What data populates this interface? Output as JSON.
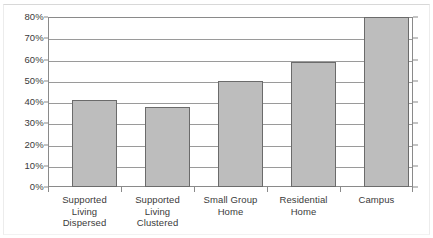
{
  "chart_data": {
    "type": "bar",
    "title": "",
    "subtitle": "",
    "xlabel": "",
    "ylabel": "",
    "categories": [
      "Supported Living Dispersed",
      "Supported Living Clustered",
      "Small Group Home",
      "Residential Home",
      "Campus"
    ],
    "category_lines": [
      [
        "Supported",
        "Living",
        "Dispersed"
      ],
      [
        "Supported",
        "Living",
        "Clustered"
      ],
      [
        "Small Group",
        "Home"
      ],
      [
        "Residential",
        "Home"
      ],
      [
        "Campus"
      ]
    ],
    "values": [
      41,
      37.5,
      50,
      59,
      80
    ],
    "value_labels": [
      "41%",
      "37.5%",
      "50%",
      "59%",
      "80%"
    ],
    "ylim": [
      0,
      80
    ],
    "ytick_values": [
      0,
      10,
      20,
      30,
      40,
      50,
      60,
      70,
      80
    ],
    "ytick_labels": [
      "0%",
      "10%",
      "20%",
      "30%",
      "40%",
      "50%",
      "60%",
      "70%",
      "80%"
    ],
    "grid": true,
    "legend": null,
    "legend_position": "none",
    "colors": {
      "bar_fill": "#bdbdbd",
      "bar_stroke": "#6b6b6b",
      "gridline": "#9a9a9a",
      "axis": "#8a8a8a",
      "text": "#3a3a3a",
      "background": "#ffffff",
      "frame": "#d8d8d8"
    }
  }
}
